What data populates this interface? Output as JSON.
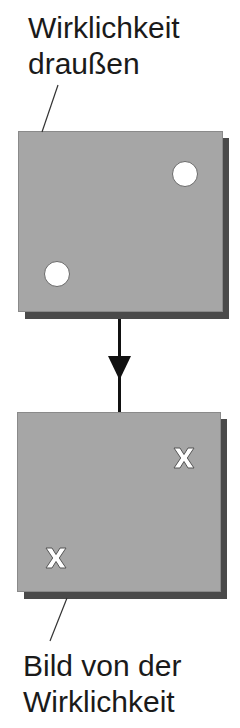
{
  "diagram": {
    "top_label": {
      "lines": [
        "Wirklichkeit",
        "draußen"
      ]
    },
    "bottom_label": {
      "lines": [
        "Bild von der",
        "Wirklichkeit"
      ]
    },
    "top_box": {
      "description": "reality outside",
      "markers": [
        "circle",
        "circle"
      ],
      "fill": "#a6a6a6",
      "shadow": "#4a4a4a"
    },
    "bottom_box": {
      "description": "image of reality",
      "markers": [
        "x",
        "x"
      ],
      "fill": "#a6a6a6",
      "shadow": "#4a4a4a"
    },
    "arrow": {
      "direction": "down",
      "color": "#111111"
    }
  }
}
